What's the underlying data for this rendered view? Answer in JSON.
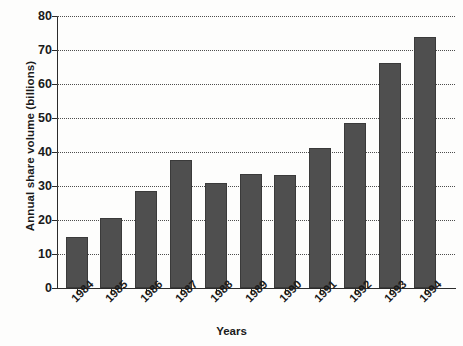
{
  "chart_data": {
    "type": "bar",
    "title": "",
    "xlabel": "Years",
    "ylabel": "Annual share volume (billions)",
    "categories": [
      "1984",
      "1985",
      "1986",
      "1987",
      "1988",
      "1989",
      "1990",
      "1991",
      "1992",
      "1993",
      "1994"
    ],
    "values": [
      15,
      20.7,
      28.6,
      37.7,
      31,
      33.5,
      33.2,
      41.3,
      48.5,
      66.2,
      73.8
    ],
    "ylim": [
      0,
      80
    ],
    "ytick_labels": [
      "0",
      "10",
      "20",
      "30",
      "40",
      "50",
      "60",
      "70",
      "80"
    ],
    "ytick_values": [
      0,
      10,
      20,
      30,
      40,
      50,
      60,
      70,
      80
    ],
    "grid": "horizontal-dotted",
    "legend": "none",
    "bar_color": "#4f4f4f",
    "axis_color": "#2b2b2b",
    "grid_color": "#4d4d4d",
    "background_color": "#fdfdfc"
  }
}
